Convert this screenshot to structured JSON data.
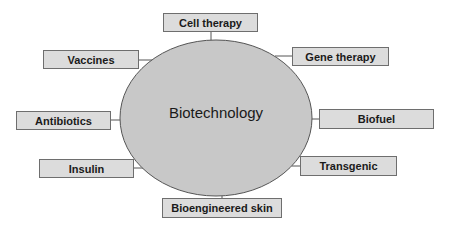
{
  "diagram": {
    "center": {
      "label": "Biotechnology",
      "fill": "#c8c8c8",
      "stroke": "#555555"
    },
    "nodes": [
      {
        "id": "cell-therapy",
        "label": "Cell therapy",
        "x": 163,
        "y": 13,
        "w": 95,
        "h": 19
      },
      {
        "id": "vaccines",
        "label": "Vaccines",
        "x": 43,
        "y": 50,
        "w": 96,
        "h": 19
      },
      {
        "id": "gene-therapy",
        "label": "Gene therapy",
        "x": 292,
        "y": 47,
        "w": 97,
        "h": 19
      },
      {
        "id": "antibiotics",
        "label": "Antibiotics",
        "x": 16,
        "y": 111,
        "w": 95,
        "h": 19
      },
      {
        "id": "biofuel",
        "label": "Biofuel",
        "x": 319,
        "y": 109,
        "w": 115,
        "h": 20
      },
      {
        "id": "insulin",
        "label": "Insulin",
        "x": 39,
        "y": 159,
        "w": 95,
        "h": 19
      },
      {
        "id": "transgenic",
        "label": "Transgenic",
        "x": 300,
        "y": 156,
        "w": 97,
        "h": 20
      },
      {
        "id": "bioengineered-skin",
        "label": "Bioengineered skin",
        "x": 162,
        "y": 198,
        "w": 120,
        "h": 20
      }
    ],
    "box_fill": "#dcdcdc",
    "box_stroke": "#6e6e6e"
  }
}
